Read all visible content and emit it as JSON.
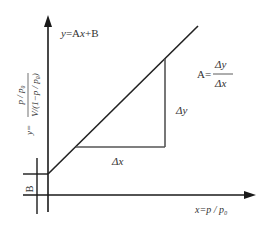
{
  "diagram": {
    "equation_label": "y=Ax+B",
    "equation_parts": {
      "y": "y",
      "eq": "=A",
      "x": "x",
      "rest": "+B"
    },
    "slope_label": {
      "prefix": "A=",
      "numerator": "Δy",
      "denominator": "Δx"
    },
    "delta_x_label": "Δx",
    "delta_y_label": "Δy",
    "intercept_label": "B",
    "y_axis_label": {
      "prefix": "y=",
      "numerator": "p / p₀",
      "denominator": "V/(1−p / p₀)"
    },
    "x_axis_label": {
      "prefix": "x=",
      "value": "p / p₀"
    },
    "colors": {
      "axis": "#1a1a1a",
      "line": "#222222",
      "triangle": "#555555",
      "text": "#333333",
      "background": "#ffffff"
    }
  }
}
